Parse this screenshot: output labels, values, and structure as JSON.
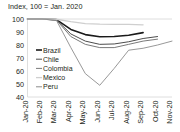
{
  "chart_data": {
    "type": "line",
    "title": "Index, 100 = Jan. 2020",
    "xlabel": "",
    "ylabel": "",
    "ylim": [
      40,
      100
    ],
    "yticks": [
      40,
      50,
      60,
      70,
      80,
      90,
      100
    ],
    "grid": false,
    "legend_position": "inside-left",
    "categories": [
      "Jan-20",
      "Feb-20",
      "Mar-20",
      "Apr-20",
      "May-20",
      "Jun-20",
      "Jul-20",
      "Aug-20",
      "Sep-20",
      "Oct-20",
      "Nov-20"
    ],
    "series": [
      {
        "name": "Brazil",
        "color": "#1a1a1a",
        "width": 1.6,
        "values": [
          100,
          100,
          99.5,
          92,
          88,
          86.3,
          86.5,
          87.5,
          89.5,
          null,
          null
        ]
      },
      {
        "name": "Chile",
        "color": "#4d4d4d",
        "width": 1.0,
        "values": [
          100,
          100,
          99.3,
          88.5,
          83,
          80.5,
          80.8,
          82.5,
          85,
          86.5,
          null
        ]
      },
      {
        "name": "Colombia",
        "color": "#7a7a7a",
        "width": 1.0,
        "values": [
          100,
          100,
          99.2,
          86.5,
          80.5,
          78,
          78,
          80.5,
          83,
          84.5,
          null
        ]
      },
      {
        "name": "Mexico",
        "color": "#cfcfcf",
        "width": 1.3,
        "values": [
          100,
          100,
          99.8,
          98,
          96.5,
          96,
          95.8,
          95.8,
          95.5,
          null,
          null
        ]
      },
      {
        "name": "Peru",
        "color": "#8c8c8c",
        "width": 0.9,
        "values": [
          100,
          100,
          99,
          78,
          58,
          49,
          62,
          76,
          77.5,
          80,
          83
        ]
      }
    ]
  }
}
